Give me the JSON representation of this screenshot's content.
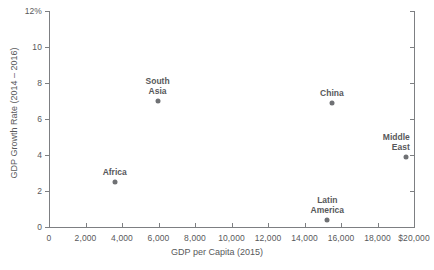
{
  "chart_data": {
    "type": "scatter",
    "title": "",
    "xlabel": "GDP per Capita (2015)",
    "ylabel": "GDP Growth Rate (2014 – 2016)",
    "xlim": [
      0,
      20000
    ],
    "ylim": [
      0,
      12
    ],
    "grid": false,
    "legend": "none",
    "x_ticks": [
      {
        "value": 0,
        "label": "0"
      },
      {
        "value": 2000,
        "label": "2,000"
      },
      {
        "value": 4000,
        "label": "4,000"
      },
      {
        "value": 6000,
        "label": "6,000"
      },
      {
        "value": 8000,
        "label": "8,000"
      },
      {
        "value": 10000,
        "label": "10,000"
      },
      {
        "value": 12000,
        "label": "12,000"
      },
      {
        "value": 14000,
        "label": "14,000"
      },
      {
        "value": 16000,
        "label": "16,000"
      },
      {
        "value": 18000,
        "label": "18,000"
      },
      {
        "value": 20000,
        "label": "$20,000"
      }
    ],
    "y_ticks": [
      {
        "value": 0,
        "label": "0"
      },
      {
        "value": 2,
        "label": "2"
      },
      {
        "value": 4,
        "label": "4"
      },
      {
        "value": 6,
        "label": "6"
      },
      {
        "value": 8,
        "label": "8"
      },
      {
        "value": 10,
        "label": "10"
      },
      {
        "value": 12,
        "label": "12%"
      }
    ],
    "points": [
      {
        "name": "Africa",
        "label": "Africa",
        "x": 3600,
        "y": 2.5,
        "label_pos": "above"
      },
      {
        "name": "South Asia",
        "label": "South\nAsia",
        "x": 5950,
        "y": 7.0,
        "label_pos": "above"
      },
      {
        "name": "China",
        "label": "China",
        "x": 15500,
        "y": 6.9,
        "label_pos": "above"
      },
      {
        "name": "Latin America",
        "label": "Latin\nAmerica",
        "x": 15250,
        "y": 0.4,
        "label_pos": "above"
      },
      {
        "name": "Middle East",
        "label": "Middle\nEast",
        "x": 19550,
        "y": 3.9,
        "label_pos": "above-right"
      }
    ]
  },
  "colors": {
    "axis": "#7d7f82",
    "text": "#58595b",
    "marker": "#6f7174",
    "background": "#ffffff"
  }
}
